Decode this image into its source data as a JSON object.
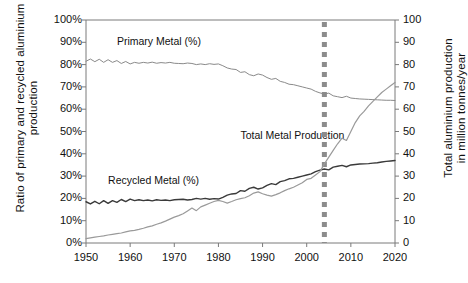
{
  "chart_data": {
    "type": "line",
    "title": "",
    "xlabel": "",
    "ylabel_left": "Ratio of primary and recycled aluminium\nproduction",
    "ylabel_right": "Total aluminium production\nin million tonnes/year",
    "xlim": [
      1950,
      2020
    ],
    "ylim_left": [
      0,
      100
    ],
    "ylim_right": [
      0,
      100
    ],
    "grid": false,
    "legend_position": "inline-annotations",
    "xticks": [
      "1950",
      "1960",
      "1970",
      "1980",
      "1990",
      "2000",
      "2010",
      "2020"
    ],
    "xtick_values": [
      1950,
      1960,
      1970,
      1980,
      1990,
      2000,
      2010,
      2020
    ],
    "yticks_left": [
      "0%",
      "10%",
      "20%",
      "30%",
      "40%",
      "50%",
      "60%",
      "70%",
      "80%",
      "90%",
      "100%"
    ],
    "ytick_values_left": [
      0,
      10,
      20,
      30,
      40,
      50,
      60,
      70,
      80,
      90,
      100
    ],
    "yticks_right": [
      "0",
      "10",
      "20",
      "30",
      "40",
      "50",
      "60",
      "70",
      "80",
      "90",
      "100"
    ],
    "ytick_values_right": [
      0,
      10,
      20,
      30,
      40,
      50,
      60,
      70,
      80,
      90,
      100
    ],
    "annotations": [
      {
        "text": "Primary Metal (%)",
        "x": 1957,
        "y_left": 90,
        "name": "primary-metal-label"
      },
      {
        "text": "Recycled Metal (%)",
        "x": 1955,
        "y_left": 28,
        "name": "recycled-metal-label"
      },
      {
        "text": "Total Metal Production",
        "x": 1985,
        "y_left": 48,
        "name": "total-metal-production-label"
      }
    ],
    "marker_line": {
      "label": "",
      "x": 2004,
      "style": "dashed",
      "color": "#8c8c8c",
      "width": 5
    },
    "colors": {
      "primary_metal": "#8a8a8a",
      "recycled_metal": "#3a3a3a",
      "total_production": "#9a9a9a",
      "marker": "#8c8c8c",
      "axis": "#7a7a7a",
      "text": "#111111"
    },
    "x": [
      1950,
      1951,
      1952,
      1953,
      1954,
      1955,
      1956,
      1957,
      1958,
      1959,
      1960,
      1961,
      1962,
      1963,
      1964,
      1965,
      1966,
      1967,
      1968,
      1969,
      1970,
      1971,
      1972,
      1973,
      1974,
      1975,
      1976,
      1977,
      1978,
      1979,
      1980,
      1981,
      1982,
      1983,
      1984,
      1985,
      1986,
      1987,
      1988,
      1989,
      1990,
      1991,
      1992,
      1993,
      1994,
      1995,
      1996,
      1997,
      1998,
      1999,
      2000,
      2001,
      2002,
      2003,
      2004,
      2005,
      2006,
      2007,
      2008,
      2009,
      2010,
      2011,
      2012,
      2013,
      2014,
      2015,
      2016,
      2017,
      2018,
      2019,
      2020
    ],
    "series": [
      {
        "name": "Primary Metal (%)",
        "axis": "left",
        "unit": "%",
        "values": [
          81.5,
          82.5,
          81.3,
          82.4,
          81.0,
          82.2,
          81.0,
          81.8,
          80.5,
          81.4,
          80.3,
          81.0,
          80.6,
          81.0,
          80.7,
          81.1,
          80.6,
          80.9,
          80.7,
          81.0,
          80.6,
          80.5,
          80.4,
          80.7,
          80.5,
          80.0,
          80.3,
          80.0,
          80.4,
          80.1,
          80.3,
          79.5,
          78.5,
          78.0,
          77.8,
          76.5,
          76.8,
          75.5,
          75.0,
          75.8,
          75.3,
          74.2,
          73.4,
          73.8,
          72.5,
          72.0,
          71.2,
          71.0,
          70.5,
          70.0,
          69.5,
          69.0,
          68.0,
          67.3,
          66.8,
          67.2,
          66.0,
          65.6,
          65.2,
          65.8,
          65.0,
          64.8,
          64.6,
          64.5,
          64.4,
          64.3,
          64.2,
          64.1,
          64.0,
          64.0,
          63.9
        ]
      },
      {
        "name": "Recycled Metal (%)",
        "axis": "left",
        "unit": "%",
        "values": [
          18.5,
          17.5,
          18.7,
          17.6,
          19.0,
          17.8,
          19.0,
          18.2,
          19.5,
          18.6,
          19.7,
          19.0,
          19.4,
          19.0,
          19.3,
          18.9,
          19.4,
          19.1,
          19.3,
          19.0,
          19.4,
          19.5,
          19.6,
          19.3,
          19.5,
          20.0,
          19.7,
          20.0,
          19.6,
          19.9,
          19.7,
          20.5,
          21.5,
          22.0,
          22.2,
          23.5,
          23.2,
          24.5,
          25.0,
          24.2,
          24.7,
          25.8,
          26.6,
          26.2,
          27.5,
          28.0,
          28.8,
          29.0,
          29.5,
          30.0,
          30.5,
          31.0,
          32.0,
          32.7,
          33.2,
          32.8,
          34.0,
          34.4,
          34.8,
          34.2,
          35.0,
          35.2,
          35.4,
          35.5,
          35.6,
          35.8,
          36.0,
          36.3,
          36.6,
          36.8,
          37.0
        ]
      },
      {
        "name": "Total Metal Production",
        "axis": "right",
        "unit": "million tonnes/year",
        "values": [
          2.0,
          2.3,
          2.6,
          2.9,
          3.2,
          3.6,
          3.9,
          4.2,
          4.5,
          5.0,
          5.4,
          5.7,
          6.1,
          6.6,
          7.2,
          7.7,
          8.4,
          9.0,
          9.8,
          10.7,
          11.6,
          12.3,
          13.1,
          14.4,
          15.7,
          14.5,
          16.2,
          17.0,
          17.8,
          18.6,
          19.1,
          18.6,
          17.9,
          18.6,
          19.4,
          19.9,
          20.3,
          21.2,
          22.4,
          22.9,
          22.1,
          21.5,
          21.0,
          21.7,
          22.5,
          23.5,
          24.3,
          25.0,
          26.0,
          27.0,
          28.5,
          29.0,
          30.5,
          32.0,
          35.5,
          38.5,
          41.5,
          44.5,
          47.0,
          46.0,
          50.0,
          54.0,
          57.0,
          59.0,
          61.5,
          63.5,
          65.5,
          67.5,
          69.0,
          70.5,
          72.0
        ]
      }
    ]
  }
}
